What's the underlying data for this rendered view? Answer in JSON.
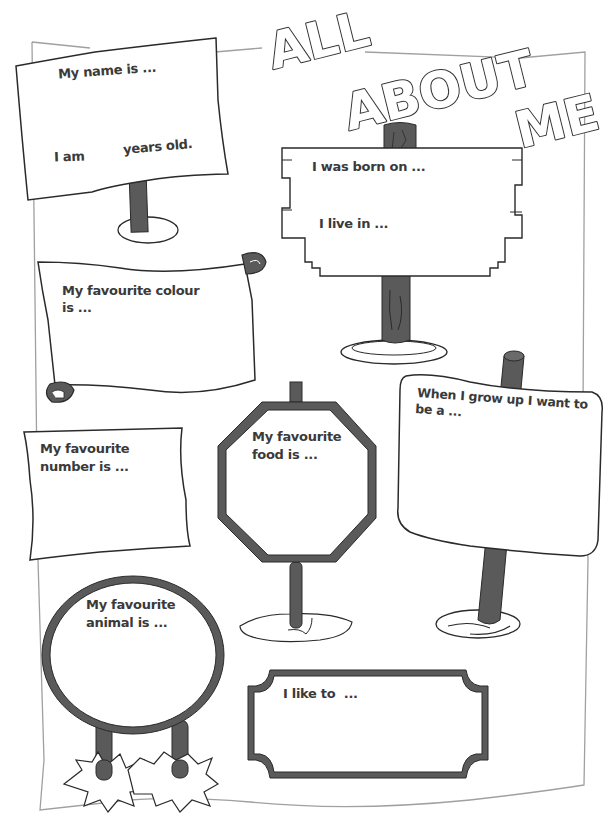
{
  "worksheet": {
    "title": {
      "line1": "ALL",
      "line2": "ABOUT",
      "line3": "ME"
    },
    "colors": {
      "ink": "#2a2a2a",
      "pole": "#5a5a5a",
      "frame": "#9a9a9a",
      "paper": "#ffffff",
      "text": "#3a3a3a"
    },
    "signs": [
      {
        "id": "name",
        "shape": "flag-board",
        "prompt": "My name is ...",
        "prompt2_left": "I am",
        "prompt2_right": "years old."
      },
      {
        "id": "born",
        "shape": "wooden-board",
        "prompt": "I was born on ...",
        "prompt2": "I live in ..."
      },
      {
        "id": "colour",
        "shape": "scroll",
        "prompt_line1": "My favourite colour",
        "prompt_line2": "is ..."
      },
      {
        "id": "grow-up",
        "shape": "curved-board",
        "prompt_line1": "When I grow up I want to",
        "prompt_line2": "be a ..."
      },
      {
        "id": "number",
        "shape": "wavy-paper",
        "prompt_line1": "My favourite",
        "prompt_line2": "number is ..."
      },
      {
        "id": "food",
        "shape": "octagon",
        "prompt_line1": "My favourite",
        "prompt_line2": "food is ..."
      },
      {
        "id": "animal",
        "shape": "circle",
        "prompt_line1": "My favourite",
        "prompt_line2": "animal is ..."
      },
      {
        "id": "like",
        "shape": "ticket-frame",
        "prompt": "I like to  ..."
      }
    ]
  }
}
